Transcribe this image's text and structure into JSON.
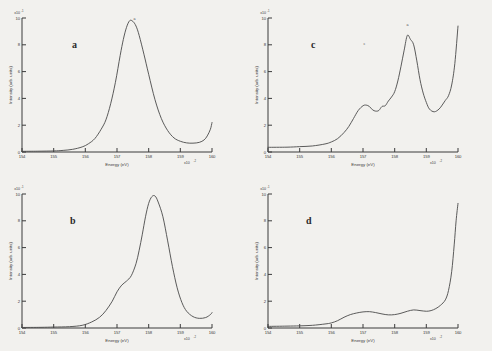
{
  "figure": {
    "background_color": "#f2f1ee",
    "curve_color": "#4a4a4a",
    "axis_color": "#3b3b3b",
    "panel_count": 4
  },
  "axes": {
    "xlabel": "Energy (eV)",
    "ylabel": "Intensity (arb. units)",
    "x_ticks": [
      "154",
      "155",
      "156",
      "157",
      "158",
      "159",
      "160"
    ],
    "y_ticks": [
      "0",
      "2",
      "4",
      "6",
      "8",
      "10"
    ],
    "x_exponent_mantissa": "x10",
    "x_exponent_power": "-2",
    "y_exponent_mantissa": "x10",
    "y_exponent_power": "-1",
    "xlim": [
      154,
      160
    ],
    "ylim": [
      0,
      10
    ]
  },
  "chart_data": [
    {
      "type": "line",
      "panel": "a",
      "title": "a",
      "xlabel": "Energy (eV)",
      "ylabel": "Intensity (arb. units)",
      "xlim": [
        154,
        160
      ],
      "ylim": [
        0,
        10
      ],
      "grid": false,
      "legend": "none",
      "annotations": [
        {
          "label": "a",
          "x": 157.42,
          "y": 9.95
        }
      ],
      "x": [
        154.0,
        154.5,
        155.0,
        155.3,
        155.6,
        155.9,
        156.1,
        156.3,
        156.5,
        156.65,
        156.8,
        156.95,
        157.1,
        157.2,
        157.3,
        157.4,
        157.5,
        157.6,
        157.7,
        157.85,
        158.0,
        158.2,
        158.4,
        158.6,
        158.8,
        159.0,
        159.2,
        159.4,
        159.6,
        159.75,
        159.85,
        159.95,
        160.0
      ],
      "y": [
        0.05,
        0.06,
        0.08,
        0.12,
        0.2,
        0.38,
        0.62,
        1.0,
        1.7,
        2.4,
        3.6,
        5.2,
        7.2,
        8.4,
        9.3,
        9.8,
        9.75,
        9.4,
        8.7,
        7.3,
        5.8,
        3.9,
        2.5,
        1.6,
        1.05,
        0.8,
        0.68,
        0.66,
        0.72,
        0.9,
        1.2,
        1.7,
        2.2
      ]
    },
    {
      "type": "line",
      "panel": "b",
      "title": "b",
      "xlabel": "Energy (eV)",
      "ylabel": "Intensity (arb. units)",
      "xlim": [
        154,
        160
      ],
      "ylim": [
        0,
        10
      ],
      "grid": false,
      "legend": "none",
      "annotations": [],
      "x": [
        154.0,
        154.6,
        155.0,
        155.5,
        155.9,
        156.2,
        156.45,
        156.65,
        156.85,
        157.0,
        157.15,
        157.3,
        157.45,
        157.6,
        157.7,
        157.8,
        157.9,
        158.0,
        158.1,
        158.2,
        158.3,
        158.45,
        158.6,
        158.75,
        158.9,
        159.05,
        159.2,
        159.4,
        159.6,
        159.8,
        159.95,
        160.0
      ],
      "y": [
        0.04,
        0.05,
        0.07,
        0.1,
        0.2,
        0.45,
        0.8,
        1.3,
        2.0,
        2.7,
        3.2,
        3.5,
        3.9,
        4.8,
        5.8,
        7.0,
        8.3,
        9.3,
        9.8,
        9.85,
        9.4,
        8.3,
        6.5,
        4.6,
        3.0,
        1.9,
        1.25,
        0.85,
        0.72,
        0.78,
        1.0,
        1.15
      ]
    },
    {
      "type": "line",
      "panel": "c",
      "title": "c",
      "xlabel": "Energy (eV)",
      "ylabel": "Intensity (arb. units)",
      "xlim": [
        154,
        160
      ],
      "ylim": [
        0,
        10
      ],
      "grid": false,
      "legend": "none",
      "annotations": [
        {
          "label": "c",
          "x": 157.05,
          "y": 3.95
        },
        {
          "label": "a",
          "x": 158.42,
          "y": 9.35
        }
      ],
      "x": [
        154.0,
        154.6,
        155.0,
        155.4,
        155.8,
        156.0,
        156.2,
        156.4,
        156.55,
        156.7,
        156.85,
        157.0,
        157.1,
        157.2,
        157.3,
        157.4,
        157.5,
        157.6,
        157.7,
        157.8,
        157.9,
        158.0,
        158.1,
        158.2,
        158.3,
        158.4,
        158.5,
        158.6,
        158.7,
        158.8,
        158.9,
        159.0,
        159.1,
        159.25,
        159.4,
        159.5,
        159.6,
        159.7,
        159.8,
        159.9,
        160.0
      ],
      "y": [
        0.35,
        0.36,
        0.4,
        0.45,
        0.6,
        0.75,
        1.0,
        1.45,
        1.9,
        2.5,
        3.1,
        3.45,
        3.5,
        3.4,
        3.15,
        3.05,
        3.1,
        3.4,
        3.45,
        3.8,
        4.1,
        4.5,
        5.3,
        6.4,
        7.6,
        8.7,
        8.4,
        8.0,
        6.8,
        5.4,
        4.4,
        3.7,
        3.2,
        3.0,
        3.2,
        3.5,
        3.85,
        4.2,
        5.0,
        6.6,
        9.4
      ]
    },
    {
      "type": "line",
      "panel": "d",
      "title": "d",
      "xlabel": "Energy (eV)",
      "ylabel": "Intensity (arb. units)",
      "xlim": [
        154,
        160
      ],
      "ylim": [
        0,
        10
      ],
      "grid": false,
      "legend": "none",
      "annotations": [],
      "x": [
        154.0,
        154.6,
        155.0,
        155.4,
        155.8,
        156.0,
        156.2,
        156.4,
        156.6,
        156.8,
        157.0,
        157.2,
        157.4,
        157.6,
        157.8,
        158.0,
        158.2,
        158.4,
        158.6,
        158.8,
        159.0,
        159.15,
        159.3,
        159.45,
        159.6,
        159.7,
        159.8,
        159.88,
        159.94,
        160.0
      ],
      "y": [
        0.12,
        0.14,
        0.16,
        0.2,
        0.3,
        0.38,
        0.55,
        0.8,
        1.0,
        1.12,
        1.2,
        1.22,
        1.15,
        1.05,
        0.98,
        1.0,
        1.1,
        1.25,
        1.35,
        1.3,
        1.25,
        1.3,
        1.45,
        1.7,
        2.1,
        2.8,
        4.2,
        6.2,
        8.0,
        9.3
      ]
    }
  ]
}
